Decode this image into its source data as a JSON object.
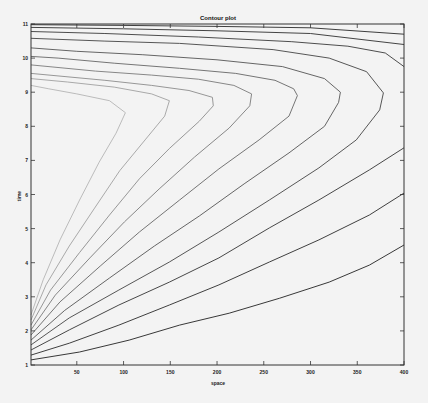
{
  "chart_data": {
    "type": "contour",
    "title": "Contour plot",
    "xlabel": "space",
    "ylabel": "time",
    "xlim": [
      1,
      400
    ],
    "ylim": [
      1,
      11
    ],
    "xticks": [
      50,
      100,
      150,
      200,
      250,
      300,
      350,
      400
    ],
    "yticks": [
      1,
      2,
      3,
      4,
      5,
      6,
      7,
      8,
      9,
      10,
      11
    ],
    "grid": false,
    "legend": null,
    "contours": [
      {
        "shade": "#222222",
        "points": [
          [
            1,
            1.15
          ],
          [
            53,
            1.38
          ],
          [
            106,
            1.73
          ],
          [
            160,
            2.17
          ],
          [
            213,
            2.52
          ],
          [
            267,
            2.96
          ],
          [
            320,
            3.43
          ],
          [
            363,
            3.93
          ],
          [
            400,
            4.52
          ]
        ]
      },
      {
        "shade": "#2a2a2a",
        "points": [
          [
            1,
            1.29
          ],
          [
            42,
            1.64
          ],
          [
            95,
            2.17
          ],
          [
            149,
            2.76
          ],
          [
            202,
            3.35
          ],
          [
            256,
            4.02
          ],
          [
            309,
            4.67
          ],
          [
            363,
            5.4
          ],
          [
            400,
            6.04
          ]
        ]
      },
      {
        "shade": "#333333",
        "points": [
          [
            1,
            1.44
          ],
          [
            42,
            2.03
          ],
          [
            95,
            2.76
          ],
          [
            149,
            3.43
          ],
          [
            202,
            4.14
          ],
          [
            256,
            5.02
          ],
          [
            309,
            5.84
          ],
          [
            363,
            6.72
          ],
          [
            400,
            7.37
          ]
        ]
      },
      {
        "shade": "#444444",
        "points": [
          [
            1,
            1.59
          ],
          [
            42,
            2.38
          ],
          [
            95,
            3.2
          ],
          [
            149,
            4.02
          ],
          [
            202,
            4.9
          ],
          [
            256,
            5.84
          ],
          [
            309,
            6.78
          ],
          [
            349,
            7.6
          ],
          [
            374,
            8.48
          ],
          [
            378,
            8.98
          ],
          [
            360,
            9.6
          ],
          [
            320,
            10.0
          ],
          [
            260,
            10.25
          ],
          [
            160,
            10.43
          ],
          [
            80,
            10.5
          ],
          [
            1,
            10.58
          ]
        ]
      },
      {
        "shade": "#555555",
        "points": [
          [
            1,
            1.73
          ],
          [
            37,
            2.6
          ],
          [
            85,
            3.55
          ],
          [
            133,
            4.49
          ],
          [
            181,
            5.37
          ],
          [
            229,
            6.31
          ],
          [
            277,
            7.22
          ],
          [
            315,
            8.0
          ],
          [
            330,
            8.7
          ],
          [
            332,
            9.0
          ],
          [
            315,
            9.4
          ],
          [
            270,
            9.75
          ],
          [
            200,
            9.95
          ],
          [
            120,
            10.1
          ],
          [
            50,
            10.2
          ],
          [
            1,
            10.3
          ]
        ]
      },
      {
        "shade": "#666666",
        "points": [
          [
            1,
            1.88
          ],
          [
            32,
            2.85
          ],
          [
            75,
            3.9
          ],
          [
            117,
            4.9
          ],
          [
            160,
            5.84
          ],
          [
            202,
            6.75
          ],
          [
            245,
            7.6
          ],
          [
            277,
            8.3
          ],
          [
            286,
            8.9
          ],
          [
            282,
            9.1
          ],
          [
            262,
            9.35
          ],
          [
            220,
            9.55
          ],
          [
            160,
            9.7
          ],
          [
            90,
            9.85
          ],
          [
            30,
            10.0
          ],
          [
            1,
            10.05
          ]
        ]
      },
      {
        "shade": "#7a7a7a",
        "points": [
          [
            1,
            2.03
          ],
          [
            27,
            3.05
          ],
          [
            64,
            4.14
          ],
          [
            101,
            5.2
          ],
          [
            138,
            6.16
          ],
          [
            176,
            7.1
          ],
          [
            213,
            7.95
          ],
          [
            235,
            8.6
          ],
          [
            237,
            8.95
          ],
          [
            218,
            9.2
          ],
          [
            180,
            9.38
          ],
          [
            130,
            9.5
          ],
          [
            70,
            9.62
          ],
          [
            1,
            9.8
          ]
        ]
      },
      {
        "shade": "#8c8c8c",
        "points": [
          [
            1,
            2.17
          ],
          [
            22,
            3.2
          ],
          [
            53,
            4.3
          ],
          [
            85,
            5.4
          ],
          [
            117,
            6.46
          ],
          [
            149,
            7.35
          ],
          [
            181,
            8.15
          ],
          [
            196,
            8.6
          ],
          [
            195,
            8.85
          ],
          [
            170,
            9.05
          ],
          [
            130,
            9.2
          ],
          [
            80,
            9.35
          ],
          [
            1,
            9.55
          ]
        ]
      },
      {
        "shade": "#a0a0a0",
        "points": [
          [
            1,
            2.32
          ],
          [
            17,
            3.35
          ],
          [
            42,
            4.49
          ],
          [
            69,
            5.6
          ],
          [
            96,
            6.7
          ],
          [
            123,
            7.6
          ],
          [
            144,
            8.3
          ],
          [
            149,
            8.75
          ],
          [
            130,
            8.95
          ],
          [
            90,
            9.15
          ],
          [
            40,
            9.3
          ],
          [
            1,
            9.4
          ]
        ]
      },
      {
        "shade": "#b4b4b4",
        "points": [
          [
            1,
            2.47
          ],
          [
            14,
            3.5
          ],
          [
            32,
            4.67
          ],
          [
            53,
            5.84
          ],
          [
            74,
            6.95
          ],
          [
            92,
            7.8
          ],
          [
            102,
            8.4
          ],
          [
            85,
            8.75
          ],
          [
            50,
            8.95
          ],
          [
            20,
            9.1
          ],
          [
            1,
            9.2
          ]
        ]
      },
      {
        "shade": "#3a3a3a",
        "points": [
          [
            1,
            10.78
          ],
          [
            80,
            10.72
          ],
          [
            180,
            10.62
          ],
          [
            280,
            10.48
          ],
          [
            340,
            10.35
          ],
          [
            380,
            10.15
          ],
          [
            400,
            9.75
          ]
        ]
      },
      {
        "shade": "#303030",
        "points": [
          [
            1,
            10.9
          ],
          [
            100,
            10.86
          ],
          [
            200,
            10.8
          ],
          [
            300,
            10.72
          ],
          [
            400,
            10.4
          ]
        ]
      },
      {
        "shade": "#2a2a2a",
        "points": [
          [
            1,
            10.98
          ],
          [
            100,
            10.96
          ],
          [
            200,
            10.93
          ],
          [
            300,
            10.89
          ],
          [
            400,
            10.7
          ]
        ]
      }
    ]
  }
}
